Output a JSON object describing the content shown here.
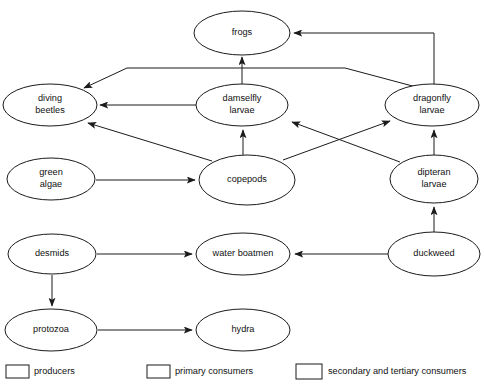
{
  "diagram": {
    "type": "food-web-diagram",
    "background_color": "#ffffff",
    "line_color": "#1b1b1b",
    "text_color": "#111111",
    "nodes": [
      {
        "id": "frogs",
        "label": "frogs",
        "label_line1": "frogs",
        "label_line2": "",
        "category": "secondary and tertiary consumers",
        "fill_pattern": "none",
        "cx": 242,
        "cy": 33,
        "rx": 48,
        "ry": 22
      },
      {
        "id": "diving-beetles",
        "label": "diving beetles",
        "label_line1": "diving",
        "label_line2": "beetles",
        "category": "secondary and tertiary consumers",
        "fill_pattern": "none",
        "cx": 50,
        "cy": 105,
        "rx": 47,
        "ry": 21
      },
      {
        "id": "damselfly-larvae",
        "label": "damselfly larvae",
        "label_line1": "damselfly",
        "label_line2": "larvae",
        "category": "secondary and tertiary consumers",
        "fill_pattern": "none",
        "cx": 242,
        "cy": 105,
        "rx": 46,
        "ry": 21
      },
      {
        "id": "dragonfly-larvae",
        "label": "dragonfly larvae",
        "label_line1": "dragonfly",
        "label_line2": "larvae",
        "category": "secondary and tertiary consumers",
        "fill_pattern": "none",
        "cx": 432,
        "cy": 105,
        "rx": 47,
        "ry": 21
      },
      {
        "id": "green-algae",
        "label": "green algae",
        "label_line1": "green",
        "label_line2": "algae",
        "category": "producers",
        "fill_pattern": "horizontal",
        "cx": 51,
        "cy": 179,
        "rx": 44,
        "ry": 21
      },
      {
        "id": "copepods",
        "label": "copepods",
        "label_line1": "copepods",
        "label_line2": "",
        "category": "primary consumers",
        "fill_pattern": "vertical",
        "cx": 247,
        "cy": 180,
        "rx": 48,
        "ry": 25
      },
      {
        "id": "dipteran-larvae",
        "label": "dipteran larvae",
        "label_line1": "dipteran",
        "label_line2": "larvae",
        "category": "primary consumers",
        "fill_pattern": "vertical",
        "cx": 434,
        "cy": 179,
        "rx": 44,
        "ry": 24
      },
      {
        "id": "desmids",
        "label": "desmids",
        "label_line1": "desmids",
        "label_line2": "",
        "category": "producers",
        "fill_pattern": "horizontal",
        "cx": 52,
        "cy": 254,
        "rx": 44,
        "ry": 20
      },
      {
        "id": "water-boatmen",
        "label": "water boatmen",
        "label_line1": "water boatmen",
        "label_line2": "",
        "category": "primary consumers",
        "fill_pattern": "vertical",
        "cx": 243,
        "cy": 254,
        "rx": 47,
        "ry": 21
      },
      {
        "id": "duckweed",
        "label": "duckweed",
        "label_line1": "duckweed",
        "label_line2": "",
        "category": "producers",
        "fill_pattern": "horizontal",
        "cx": 434,
        "cy": 254,
        "rx": 46,
        "ry": 22
      },
      {
        "id": "protozoa",
        "label": "protozoa",
        "label_line1": "protozoa",
        "label_line2": "",
        "category": "primary consumers",
        "fill_pattern": "vertical",
        "cx": 51,
        "cy": 330,
        "rx": 46,
        "ry": 21
      },
      {
        "id": "hydra",
        "label": "hydra",
        "label_line1": "hydra",
        "label_line2": "",
        "category": "secondary and tertiary consumers",
        "fill_pattern": "none",
        "cx": 243,
        "cy": 330,
        "rx": 47,
        "ry": 21
      }
    ],
    "edges": [
      {
        "id": "damselfly-to-frogs",
        "from": "damselfly-larvae",
        "to": "frogs",
        "path": "M 242 84 L 242 57"
      },
      {
        "id": "dragonfly-to-frogs",
        "from": "dragonfly-larvae",
        "to": "frogs",
        "path": "M 434 85 L 434 33 L 294 33"
      },
      {
        "id": "damselfly-to-divingbeetle",
        "from": "damselfly-larvae",
        "to": "diving-beetles",
        "path": "M 196 105 L 100 105"
      },
      {
        "id": "dragonfly-to-divingbeetle",
        "from": "dragonfly-larvae",
        "to": "diving-beetles",
        "path": "M 420 88 L 345 68 L 127 68 L 84 88"
      },
      {
        "id": "copepods-to-divingbeetle",
        "from": "copepods",
        "to": "diving-beetles",
        "path": "M 212 161 L 88 123"
      },
      {
        "id": "copepods-to-damselfly",
        "from": "copepods",
        "to": "damselfly-larvae",
        "path": "M 243 155 L 243 130"
      },
      {
        "id": "copepods-to-dragonfly",
        "from": "copepods",
        "to": "dragonfly-larvae",
        "path": "M 283 160 L 390 121"
      },
      {
        "id": "dipteran-to-damselfly",
        "from": "dipteran-larvae",
        "to": "damselfly-larvae",
        "path": "M 400 162 L 292 122"
      },
      {
        "id": "dipteran-to-dragonfly",
        "from": "dipteran-larvae",
        "to": "dragonfly-larvae",
        "path": "M 434 155 L 434 130"
      },
      {
        "id": "greenalgae-to-copepods",
        "from": "green-algae",
        "to": "copepods",
        "path": "M 96 180 L 195 180"
      },
      {
        "id": "desmids-to-waterboatmen",
        "from": "desmids",
        "to": "water-boatmen",
        "path": "M 97 254 L 192 254"
      },
      {
        "id": "duckweed-to-waterboatmen",
        "from": "duckweed",
        "to": "water-boatmen",
        "path": "M 388 254 L 295 254"
      },
      {
        "id": "duckweed-to-dipteran",
        "from": "duckweed",
        "to": "dipteran-larvae",
        "path": "M 434 232 L 434 207"
      },
      {
        "id": "desmids-to-protozoa",
        "from": "desmids",
        "to": "protozoa",
        "path": "M 52 275 L 52 306"
      },
      {
        "id": "protozoa-to-hydra",
        "from": "protozoa",
        "to": "hydra",
        "path": "M 98 330 L 192 330"
      }
    ],
    "legend": {
      "items": [
        {
          "id": "producers",
          "label": "producers",
          "fill_pattern": "horizontal",
          "x": 6,
          "y": 365,
          "w": 23,
          "h": 13,
          "text_x": 34
        },
        {
          "id": "primary-consumers",
          "label": "primary consumers",
          "fill_pattern": "vertical",
          "x": 147,
          "y": 365,
          "w": 23,
          "h": 13,
          "text_x": 175
        },
        {
          "id": "tertiary-consumers",
          "label": "secondary and tertiary consumers",
          "fill_pattern": "none",
          "x": 296,
          "y": 364,
          "w": 26,
          "h": 15,
          "text_x": 328
        }
      ]
    }
  }
}
